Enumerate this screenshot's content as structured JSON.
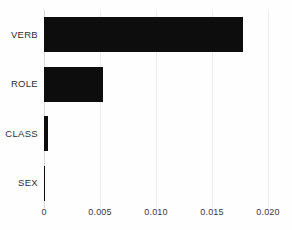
{
  "chart_data": {
    "type": "bar",
    "orientation": "horizontal",
    "title": "",
    "subtitle": "",
    "xlabel": "",
    "ylabel": "",
    "categories": [
      "VERB",
      "ROLE",
      "CLASS",
      "SEX"
    ],
    "values": [
      0.0178,
      0.0053,
      0.0004,
      5e-05
    ],
    "series": [
      {
        "name": "importance",
        "values": [
          0.0178,
          0.0053,
          0.0004,
          5e-05
        ]
      }
    ],
    "xlim": [
      0,
      0.02
    ],
    "xticks": [
      0,
      0.005,
      0.01,
      0.015,
      0.02
    ],
    "xtick_labels": [
      "0",
      "0.005",
      "0.010",
      "0.015",
      "0.020"
    ],
    "grid": "vertical",
    "legend": "none",
    "annotations": [],
    "colors": {
      "bar": "#0d0d0d",
      "gridline": "#eceaea",
      "axis": "#d8d6d6",
      "text": "#2f2f2f",
      "background": "#fefefe"
    }
  }
}
